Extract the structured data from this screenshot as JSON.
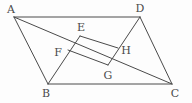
{
  "figure": {
    "kind": "geometry-diagram",
    "width": 192,
    "height": 103,
    "background_color": "#fdfdfd",
    "stroke_color": "#4a4a4a",
    "stroke_width": 1,
    "label_color": "#4a4a4a"
  },
  "points": {
    "A": {
      "label": "A",
      "x": 14,
      "y": 17,
      "label_x": 11,
      "label_y": 9
    },
    "B": {
      "label": "B",
      "x": 48,
      "y": 84,
      "label_x": 46,
      "label_y": 93
    },
    "C": {
      "label": "C",
      "x": 172,
      "y": 84,
      "label_x": 175,
      "label_y": 93
    },
    "D": {
      "label": "D",
      "x": 140,
      "y": 17,
      "label_x": 140,
      "label_y": 8
    },
    "E": {
      "label": "E",
      "x": 80,
      "y": 36,
      "label_x": 81,
      "label_y": 27
    },
    "F": {
      "label": "F",
      "x": 68,
      "y": 50,
      "label_x": 58,
      "label_y": 52
    },
    "G": {
      "label": "G",
      "x": 108,
      "y": 65,
      "label_x": 108,
      "label_y": 75
    },
    "H": {
      "label": "H",
      "x": 118,
      "y": 48,
      "label_x": 126,
      "label_y": 50
    }
  },
  "segments": [
    {
      "name": "segment-AD",
      "from": "A",
      "to": "D"
    },
    {
      "name": "segment-AB",
      "from": "A",
      "to": "B"
    },
    {
      "name": "segment-BC",
      "from": "B",
      "to": "C"
    },
    {
      "name": "segment-DC",
      "from": "D",
      "to": "C"
    },
    {
      "name": "segment-AC",
      "from": "A",
      "to": "C"
    },
    {
      "name": "segment-BE",
      "from": "B",
      "to": "E"
    },
    {
      "name": "segment-DG",
      "from": "D",
      "to": "G"
    },
    {
      "name": "segment-EH",
      "from": "E",
      "to": "H"
    },
    {
      "name": "segment-FG",
      "from": "F",
      "to": "G"
    }
  ],
  "label_order": [
    "A",
    "D",
    "E",
    "F",
    "H",
    "G",
    "B",
    "C"
  ]
}
